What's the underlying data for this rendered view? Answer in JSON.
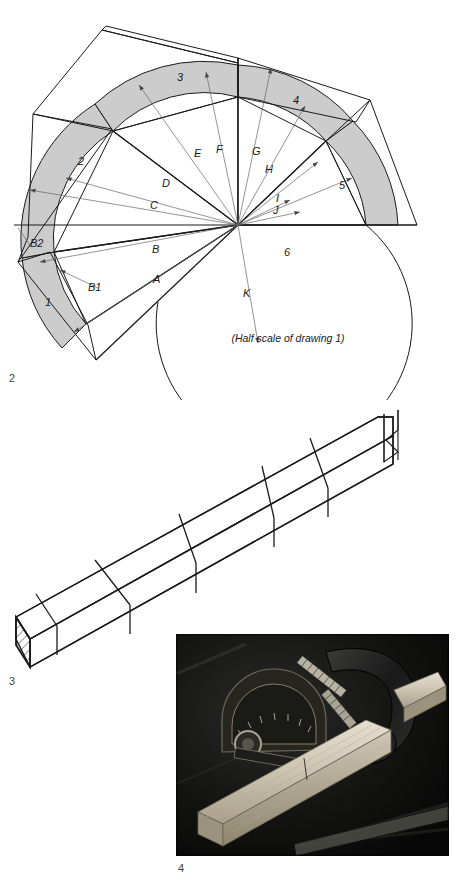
{
  "page": {
    "background": "#ffffff",
    "width": 459,
    "height": 881
  },
  "figures": [
    {
      "number": "2",
      "type": "radial-segment-layout-diagram",
      "caption": "(Half scale of drawing 1)",
      "center": {
        "x": 238,
        "y": 225
      },
      "fill_color": "#cccccc",
      "line_color": "#1a1a1a",
      "segment_labels": [
        "1",
        "2",
        "3",
        "4",
        "5",
        "6"
      ],
      "dimension_labels": [
        "A",
        "B",
        "B1",
        "B2",
        "C",
        "D",
        "E",
        "F",
        "G",
        "H",
        "I",
        "J",
        "K"
      ]
    },
    {
      "number": "3",
      "type": "isometric-beam-drawing",
      "line_color": "#1a1a1a",
      "hatch_label": "end-grain-hatching",
      "break_symbol": "zigzag-break"
    },
    {
      "number": "4",
      "type": "photograph",
      "subject": "miter-gauge-with-clamped-workpiece"
    }
  ],
  "labels": {
    "fig2": "2",
    "fig3": "3",
    "fig4": "4",
    "seg1": "1",
    "seg2": "2",
    "seg3": "3",
    "seg4": "4",
    "seg5": "5",
    "seg6": "6",
    "dimA": "A",
    "dimB": "B",
    "dimB1": "B1",
    "dimB2": "B2",
    "dimC": "C",
    "dimD": "D",
    "dimE": "E",
    "dimF": "F",
    "dimG": "G",
    "dimH": "H",
    "dimI": "I",
    "dimJ": "J",
    "dimK": "K",
    "halfScaleNote": "(Half scale of drawing 1)"
  },
  "colors": {
    "segment_fill": "#cccccc",
    "stroke": "#1a1a1a",
    "thin_stroke": "#555555",
    "figure_number": "#444444",
    "photo_dark": "#0d0d0d",
    "photo_wood": "#cfc6b4"
  }
}
